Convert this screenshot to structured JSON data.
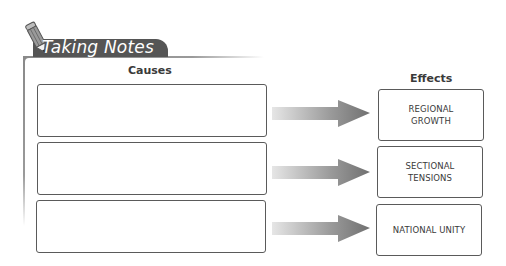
{
  "section": {
    "title": "Taking Notes",
    "icon": "pencil-icon"
  },
  "organizer": {
    "type": "cause-effect",
    "causes_header": "Causes",
    "effects_header": "Effects",
    "causes": [
      "",
      "",
      ""
    ],
    "effects": [
      "REGIONAL GROWTH",
      "SECTIONAL TENSIONS",
      "NATIONAL UNITY"
    ]
  },
  "colors": {
    "tab_background": "#555555",
    "box_border": "#5a5a5a",
    "arrow": "#7a7a7a"
  }
}
